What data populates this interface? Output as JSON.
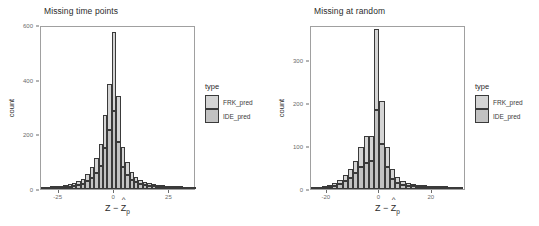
{
  "figure": {
    "width": 539,
    "height": 226,
    "background": "#ffffff",
    "panel_border_color": "#a0a0a0",
    "text_color": "#4d4d4d"
  },
  "legend": {
    "title": "type",
    "position": "right",
    "items": [
      {
        "label": "FRK_pred",
        "color": "#d4d4d4"
      },
      {
        "label": "IDE_pred",
        "color": "#c2c2c2"
      }
    ]
  },
  "axis_titles": {
    "x_main": "Z",
    "x_minus": "−",
    "x_zhat": "Z",
    "x_sub": "p",
    "x_caret": "^",
    "y": "count"
  },
  "chart_data": [
    {
      "type": "bar",
      "subtype": "stacked-histogram",
      "title": "Missing time points",
      "xlabel": "Z − Ẑp",
      "ylabel": "count",
      "xlim": [
        -33,
        37
      ],
      "ylim": [
        0,
        600
      ],
      "xticks": [
        -25,
        0,
        25
      ],
      "xtick_labels": [
        "-25",
        "0",
        "25"
      ],
      "yticks": [
        0,
        200,
        400,
        600
      ],
      "ytick_labels": [
        "0",
        "200",
        "400",
        "600"
      ],
      "grid": false,
      "legend_position": "right",
      "bin_width": 2,
      "bin_centers": [
        -32,
        -30,
        -28,
        -26,
        -24,
        -22,
        -20,
        -18,
        -16,
        -14,
        -12,
        -10,
        -8,
        -6,
        -4,
        -2,
        0,
        2,
        4,
        6,
        8,
        10,
        12,
        14,
        16,
        18,
        20,
        22,
        24,
        26,
        28,
        30,
        32,
        34,
        36
      ],
      "series": [
        {
          "name": "FRK_pred",
          "values": [
            1,
            1,
            2,
            3,
            4,
            5,
            8,
            11,
            14,
            18,
            26,
            38,
            55,
            78,
            120,
            170,
            290,
            168,
            70,
            46,
            30,
            21,
            16,
            13,
            10,
            9,
            7,
            5,
            4,
            3,
            2,
            2,
            1,
            1,
            1
          ]
        },
        {
          "name": "IDE_pred",
          "values": [
            1,
            1,
            2,
            3,
            4,
            6,
            9,
            12,
            16,
            20,
            28,
            42,
            60,
            86,
            150,
            215,
            285,
            172,
            82,
            52,
            34,
            24,
            18,
            14,
            12,
            10,
            8,
            6,
            4,
            3,
            2,
            2,
            1,
            1,
            1
          ]
        }
      ],
      "stacked_totals": [
        2,
        2,
        4,
        6,
        8,
        11,
        17,
        23,
        30,
        38,
        54,
        80,
        115,
        164,
        270,
        385,
        575,
        340,
        152,
        98,
        64,
        45,
        34,
        27,
        22,
        19,
        15,
        11,
        8,
        6,
        4,
        4,
        2,
        2,
        2
      ]
    },
    {
      "type": "bar",
      "subtype": "stacked-histogram",
      "title": "Missing at random",
      "xlabel": "Z − Ẑp",
      "ylabel": "count",
      "xlim": [
        -26,
        33
      ],
      "ylim": [
        0,
        380
      ],
      "xticks": [
        -20,
        0,
        20
      ],
      "xtick_labels": [
        "-20",
        "0",
        "20"
      ],
      "yticks": [
        0,
        100,
        200,
        300
      ],
      "ytick_labels": [
        "0",
        "100",
        "200",
        "300"
      ],
      "grid": false,
      "legend_position": "right",
      "bin_width": 2,
      "bin_centers": [
        -25,
        -23,
        -21,
        -19,
        -17,
        -15,
        -13,
        -11,
        -9,
        -7,
        -5,
        -3,
        -1,
        1,
        3,
        5,
        7,
        9,
        11,
        13,
        15,
        17,
        19,
        21,
        23,
        25,
        27,
        29,
        31
      ],
      "series": [
        {
          "name": "FRK_pred",
          "values": [
            1,
            1,
            2,
            4,
            6,
            9,
            14,
            20,
            30,
            45,
            62,
            56,
            186,
            100,
            48,
            22,
            13,
            9,
            7,
            6,
            4,
            3,
            2,
            2,
            1,
            2,
            1,
            1,
            1
          ]
        },
        {
          "name": "IDE_pred",
          "values": [
            1,
            1,
            3,
            5,
            8,
            11,
            18,
            26,
            36,
            52,
            60,
            66,
            184,
            104,
            50,
            24,
            14,
            10,
            8,
            6,
            5,
            4,
            3,
            2,
            2,
            2,
            1,
            1,
            1
          ]
        }
      ],
      "stacked_totals": [
        2,
        2,
        5,
        9,
        14,
        20,
        32,
        46,
        66,
        97,
        122,
        122,
        370,
        204,
        98,
        46,
        27,
        19,
        15,
        12,
        9,
        7,
        5,
        4,
        3,
        4,
        2,
        2,
        2
      ]
    }
  ]
}
